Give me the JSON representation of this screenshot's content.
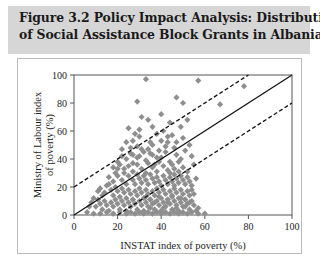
{
  "figure": {
    "title_line1": "Figure 3.2  Policy Impact Analysis: Distribution",
    "title_line2": "of Social Assistance Block Grants in Albania",
    "band_color": "#d6d6d6",
    "card_background": "#ffffff",
    "card_border_color": "#b9b9b9"
  },
  "chart_data": {
    "type": "scatter",
    "title": "",
    "xlabel": "INSTAT index of poverty (%)",
    "ylabel": "Ministry of Labour index of poverty (%)",
    "xlim": [
      0,
      100
    ],
    "ylim": [
      0,
      100
    ],
    "xticks": [
      0,
      20,
      40,
      60,
      80,
      100
    ],
    "yticks": [
      0,
      20,
      40,
      60,
      80,
      100
    ],
    "xticklabels": [
      "0",
      "20",
      "40",
      "60",
      "80",
      "100"
    ],
    "yticklabels": [
      "0",
      "20",
      "40",
      "60",
      "80",
      "100"
    ],
    "grid": false,
    "legend": null,
    "marker": {
      "shape": "diamond",
      "color": "#8e8e8e",
      "size": 3.1
    },
    "reference_lines": [
      {
        "name": "identity-line",
        "style": "solid",
        "color": "#111111",
        "slope": 1,
        "intercept": 0,
        "x_from": 0,
        "x_to": 100
      },
      {
        "name": "upper-band-line",
        "style": "dashed",
        "color": "#111111",
        "slope": 1,
        "intercept": 20,
        "x_from": 0,
        "x_to": 80
      },
      {
        "name": "lower-band-line",
        "style": "dashed",
        "color": "#111111",
        "slope": 1,
        "intercept": -20,
        "x_from": 20,
        "x_to": 100
      }
    ],
    "points": [
      [
        33,
        97
      ],
      [
        29,
        81
      ],
      [
        31,
        70
      ],
      [
        25,
        62
      ],
      [
        36,
        63
      ],
      [
        47,
        84
      ],
      [
        50,
        80
      ],
      [
        57,
        96
      ],
      [
        67,
        79
      ],
      [
        78,
        92
      ],
      [
        34,
        68
      ],
      [
        40,
        72
      ],
      [
        44,
        66
      ],
      [
        38,
        58
      ],
      [
        27,
        53
      ],
      [
        30,
        56
      ],
      [
        35,
        52
      ],
      [
        41,
        60
      ],
      [
        45,
        57
      ],
      [
        49,
        63
      ],
      [
        52,
        68
      ],
      [
        22,
        47
      ],
      [
        26,
        44
      ],
      [
        29,
        49
      ],
      [
        32,
        45
      ],
      [
        36,
        50
      ],
      [
        39,
        46
      ],
      [
        43,
        52
      ],
      [
        46,
        48
      ],
      [
        50,
        55
      ],
      [
        53,
        50
      ],
      [
        24,
        40
      ],
      [
        27,
        37
      ],
      [
        30,
        42
      ],
      [
        33,
        39
      ],
      [
        35,
        44
      ],
      [
        37,
        36
      ],
      [
        40,
        41
      ],
      [
        42,
        45
      ],
      [
        44,
        38
      ],
      [
        47,
        43
      ],
      [
        49,
        40
      ],
      [
        51,
        46
      ],
      [
        54,
        42
      ],
      [
        20,
        33
      ],
      [
        23,
        30
      ],
      [
        25,
        35
      ],
      [
        27,
        31
      ],
      [
        29,
        36
      ],
      [
        31,
        33
      ],
      [
        33,
        30
      ],
      [
        34,
        37
      ],
      [
        36,
        34
      ],
      [
        38,
        31
      ],
      [
        39,
        38
      ],
      [
        41,
        35
      ],
      [
        43,
        32
      ],
      [
        45,
        36
      ],
      [
        46,
        33
      ],
      [
        48,
        38
      ],
      [
        50,
        34
      ],
      [
        52,
        31
      ],
      [
        55,
        36
      ],
      [
        16,
        27
      ],
      [
        18,
        24
      ],
      [
        20,
        28
      ],
      [
        22,
        25
      ],
      [
        24,
        22
      ],
      [
        25,
        28
      ],
      [
        27,
        25
      ],
      [
        28,
        22
      ],
      [
        29,
        29
      ],
      [
        30,
        26
      ],
      [
        31,
        23
      ],
      [
        32,
        28
      ],
      [
        33,
        25
      ],
      [
        34,
        22
      ],
      [
        35,
        29
      ],
      [
        36,
        26
      ],
      [
        37,
        23
      ],
      [
        38,
        27
      ],
      [
        39,
        24
      ],
      [
        40,
        21
      ],
      [
        41,
        28
      ],
      [
        42,
        25
      ],
      [
        43,
        22
      ],
      [
        44,
        27
      ],
      [
        45,
        24
      ],
      [
        46,
        21
      ],
      [
        47,
        26
      ],
      [
        48,
        23
      ],
      [
        49,
        28
      ],
      [
        50,
        25
      ],
      [
        51,
        22
      ],
      [
        52,
        27
      ],
      [
        53,
        24
      ],
      [
        54,
        21
      ],
      [
        56,
        26
      ],
      [
        12,
        19
      ],
      [
        14,
        16
      ],
      [
        15,
        21
      ],
      [
        17,
        18
      ],
      [
        18,
        14
      ],
      [
        19,
        20
      ],
      [
        20,
        17
      ],
      [
        21,
        13
      ],
      [
        22,
        19
      ],
      [
        23,
        16
      ],
      [
        24,
        12
      ],
      [
        25,
        18
      ],
      [
        26,
        15
      ],
      [
        27,
        11
      ],
      [
        28,
        17
      ],
      [
        29,
        14
      ],
      [
        30,
        19
      ],
      [
        31,
        16
      ],
      [
        32,
        12
      ],
      [
        33,
        18
      ],
      [
        34,
        15
      ],
      [
        35,
        11
      ],
      [
        36,
        17
      ],
      [
        37,
        14
      ],
      [
        38,
        19
      ],
      [
        39,
        16
      ],
      [
        40,
        12
      ],
      [
        41,
        18
      ],
      [
        42,
        15
      ],
      [
        43,
        11
      ],
      [
        44,
        17
      ],
      [
        45,
        14
      ],
      [
        46,
        19
      ],
      [
        47,
        16
      ],
      [
        48,
        12
      ],
      [
        49,
        18
      ],
      [
        50,
        15
      ],
      [
        51,
        11
      ],
      [
        52,
        17
      ],
      [
        53,
        14
      ],
      [
        54,
        18
      ],
      [
        55,
        15
      ],
      [
        8,
        9
      ],
      [
        10,
        6
      ],
      [
        11,
        11
      ],
      [
        12,
        8
      ],
      [
        13,
        4
      ],
      [
        14,
        10
      ],
      [
        15,
        7
      ],
      [
        16,
        3
      ],
      [
        17,
        9
      ],
      [
        18,
        6
      ],
      [
        19,
        11
      ],
      [
        20,
        8
      ],
      [
        21,
        4
      ],
      [
        22,
        10
      ],
      [
        23,
        7
      ],
      [
        24,
        3
      ],
      [
        25,
        9
      ],
      [
        26,
        6
      ],
      [
        27,
        11
      ],
      [
        28,
        8
      ],
      [
        29,
        4
      ],
      [
        30,
        10
      ],
      [
        31,
        7
      ],
      [
        32,
        3
      ],
      [
        33,
        9
      ],
      [
        34,
        6
      ],
      [
        35,
        11
      ],
      [
        36,
        8
      ],
      [
        37,
        4
      ],
      [
        38,
        10
      ],
      [
        39,
        7
      ],
      [
        40,
        3
      ],
      [
        41,
        9
      ],
      [
        42,
        6
      ],
      [
        43,
        11
      ],
      [
        44,
        8
      ],
      [
        45,
        4
      ],
      [
        46,
        10
      ],
      [
        47,
        7
      ],
      [
        48,
        3
      ],
      [
        49,
        9
      ],
      [
        50,
        6
      ],
      [
        51,
        11
      ],
      [
        52,
        8
      ],
      [
        53,
        4
      ],
      [
        54,
        10
      ],
      [
        55,
        7
      ],
      [
        56,
        3
      ],
      [
        57,
        5
      ],
      [
        6,
        2
      ],
      [
        9,
        1
      ],
      [
        12,
        1
      ],
      [
        15,
        2
      ],
      [
        18,
        1
      ],
      [
        21,
        2
      ],
      [
        24,
        1
      ],
      [
        26,
        2
      ],
      [
        28,
        1
      ],
      [
        30,
        2
      ],
      [
        32,
        1
      ],
      [
        34,
        2
      ],
      [
        36,
        1
      ],
      [
        38,
        2
      ],
      [
        40,
        1
      ],
      [
        42,
        2
      ],
      [
        44,
        1
      ],
      [
        46,
        2
      ],
      [
        48,
        1
      ],
      [
        50,
        2
      ],
      [
        52,
        1
      ],
      [
        54,
        2
      ],
      [
        57,
        1
      ],
      [
        60,
        1
      ],
      [
        19,
        30
      ],
      [
        21,
        36
      ],
      [
        23,
        33
      ],
      [
        16,
        22
      ],
      [
        13,
        14
      ],
      [
        11,
        17
      ],
      [
        9,
        12
      ],
      [
        7,
        6
      ],
      [
        44,
        30
      ],
      [
        46,
        29
      ],
      [
        48,
        31
      ],
      [
        38,
        41
      ],
      [
        36,
        43
      ],
      [
        34,
        47
      ],
      [
        42,
        49
      ],
      [
        40,
        53
      ],
      [
        43,
        56
      ],
      [
        47,
        52
      ],
      [
        30,
        61
      ],
      [
        28,
        58
      ],
      [
        26,
        48
      ],
      [
        24,
        52
      ],
      [
        22,
        42
      ],
      [
        20,
        38
      ],
      [
        18,
        34
      ],
      [
        33,
        13
      ],
      [
        35,
        5
      ],
      [
        37,
        9
      ],
      [
        39,
        13
      ],
      [
        41,
        5
      ],
      [
        43,
        9
      ],
      [
        45,
        13
      ],
      [
        47,
        5
      ],
      [
        49,
        12
      ],
      [
        51,
        6
      ],
      [
        53,
        9
      ],
      [
        29,
        41
      ],
      [
        31,
        47
      ],
      [
        27,
        43
      ]
    ]
  }
}
